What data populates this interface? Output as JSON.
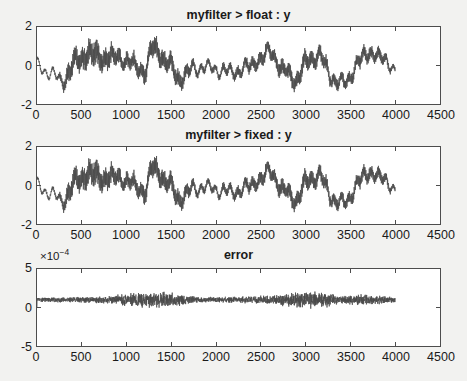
{
  "figure": {
    "width": 467,
    "height": 381,
    "background_color": "#f2f2f0",
    "axes_background_color": "#ffffff",
    "axes_border_color": "#4d4d4d",
    "trace_color": "#4a4a4a",
    "text_color": "#1a1a1a"
  },
  "chart_data": [
    {
      "type": "line",
      "title": "myfilter > float : y",
      "xlabel": "",
      "ylabel": "",
      "xlim": [
        0,
        4500
      ],
      "ylim": [
        -2,
        2
      ],
      "xticks": [
        0,
        500,
        1000,
        1500,
        2000,
        2500,
        3000,
        3500,
        4000,
        4500
      ],
      "xtick_labels": [
        "0",
        "500",
        "1000",
        "1500",
        "2000",
        "2500",
        "3000",
        "3500",
        "4000",
        "4500"
      ],
      "yticks": [
        -2,
        0,
        2
      ],
      "ytick_labels": [
        "-2",
        "0",
        "2"
      ],
      "grid": false,
      "legend": null,
      "exponent_label": null,
      "series": [
        {
          "name": "y",
          "x_range": [
            0,
            4000
          ],
          "n_points": 4000,
          "description": "noisy filtered time-series oscillating about 0 with bursts of high-frequency ripple; envelope roughly +/-1.6",
          "envelope_control_x": [
            0,
            150,
            300,
            450,
            600,
            750,
            900,
            1050,
            1200,
            1300,
            1450,
            1600,
            1750,
            1900,
            2050,
            2200,
            2350,
            2500,
            2600,
            2750,
            2900,
            3000,
            3150,
            3300,
            3450,
            3600,
            3750,
            3900,
            4000
          ],
          "envelope_control_y": [
            0.05,
            -0.45,
            -0.75,
            0.3,
            0.6,
            0.35,
            0.45,
            0.1,
            -0.3,
            0.95,
            0.15,
            -0.7,
            -0.15,
            -0.1,
            -0.25,
            -0.35,
            -0.1,
            0.35,
            0.75,
            -0.25,
            -0.75,
            0.15,
            0.55,
            -0.7,
            -0.95,
            0.3,
            0.7,
            0.2,
            -0.15
          ],
          "ripple_amplitude_x": [
            0,
            200,
            400,
            600,
            800,
            1000,
            1200,
            1400,
            1600,
            1800,
            2000,
            2200,
            2400,
            2600,
            2800,
            3000,
            3200,
            3400,
            3600,
            3800,
            4000
          ],
          "ripple_amplitude_y": [
            0.08,
            0.1,
            0.55,
            0.62,
            0.5,
            0.35,
            0.45,
            0.5,
            0.4,
            0.2,
            0.18,
            0.25,
            0.3,
            0.35,
            0.4,
            0.42,
            0.35,
            0.3,
            0.35,
            0.3,
            0.15
          ]
        }
      ]
    },
    {
      "type": "line",
      "title": "myfilter > fixed : y",
      "xlabel": "",
      "ylabel": "",
      "xlim": [
        0,
        4500
      ],
      "ylim": [
        -2,
        2
      ],
      "xticks": [
        0,
        500,
        1000,
        1500,
        2000,
        2500,
        3000,
        3500,
        4000,
        4500
      ],
      "xtick_labels": [
        "0",
        "500",
        "1000",
        "1500",
        "2000",
        "2500",
        "3000",
        "3500",
        "4000",
        "4500"
      ],
      "yticks": [
        -2,
        0,
        2
      ],
      "ytick_labels": [
        "-2",
        "0",
        "2"
      ],
      "grid": false,
      "legend": null,
      "exponent_label": null,
      "series": [
        {
          "name": "y",
          "x_range": [
            0,
            4000
          ],
          "n_points": 4000,
          "description": "fixed-point version of the float signal; visually identical to panel 1 within ~1e-4",
          "same_as": "myfilter > float : y"
        }
      ]
    },
    {
      "type": "line",
      "title": "error",
      "xlabel": "",
      "ylabel": "",
      "xlim": [
        0,
        4500
      ],
      "ylim": [
        -5,
        5
      ],
      "y_scale_exponent": -4,
      "exponent_label": "×10⁻⁴",
      "xticks": [
        0,
        500,
        1000,
        1500,
        2000,
        2500,
        3000,
        3500,
        4000,
        4500
      ],
      "xtick_labels": [
        "0",
        "500",
        "1000",
        "1500",
        "2000",
        "2500",
        "3000",
        "3500",
        "4000",
        "4500"
      ],
      "yticks": [
        -5,
        0,
        5
      ],
      "ytick_labels": [
        "-5",
        "0",
        "5"
      ],
      "grid": false,
      "legend": null,
      "series": [
        {
          "name": "error",
          "x_range": [
            0,
            4000
          ],
          "n_points": 4000,
          "description": "quantization error band centered near +1e-4 with noise spread roughly 0.3e-4 to 2.0e-4",
          "mean_level": 1.0,
          "noise_halfwidth_x": [
            0,
            400,
            800,
            1000,
            1200,
            1400,
            1600,
            1800,
            2000,
            2200,
            2400,
            2600,
            2800,
            3000,
            3200,
            3400,
            3600,
            3800,
            4000
          ],
          "noise_halfwidth_y": [
            0.22,
            0.25,
            0.35,
            0.6,
            0.7,
            0.75,
            0.6,
            0.3,
            0.28,
            0.3,
            0.32,
            0.4,
            0.6,
            0.8,
            0.7,
            0.45,
            0.5,
            0.42,
            0.25
          ]
        }
      ]
    }
  ],
  "layout": {
    "panels": [
      {
        "title_y": 8,
        "box_x": 36,
        "box_y": 26,
        "box_w": 405,
        "box_h": 79,
        "xlabel_y": 108
      },
      {
        "title_y": 128,
        "box_x": 36,
        "box_y": 146,
        "box_w": 405,
        "box_h": 79,
        "xlabel_y": 228
      },
      {
        "title_y": 248,
        "box_x": 36,
        "box_y": 268,
        "box_w": 405,
        "box_h": 79,
        "xlabel_y": 350,
        "exp_x": 40,
        "exp_y": 247
      }
    ]
  }
}
